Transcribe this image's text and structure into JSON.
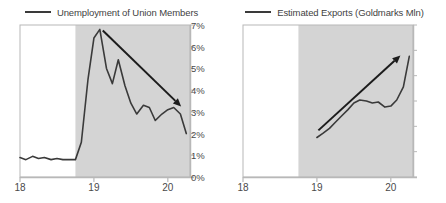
{
  "chart_data": [
    {
      "id": "unemployment",
      "type": "line",
      "title": "Unemployment of Union Members",
      "legend_label": "Unemployment of Union Members",
      "legend_position": "top-center",
      "xlabel": "",
      "ylabel": "",
      "ylim": [
        0,
        7
      ],
      "xlim": [
        18.0,
        20.3
      ],
      "y_ticks": [
        "0%",
        "1%",
        "2%",
        "3%",
        "4%",
        "5%",
        "6%",
        "7%"
      ],
      "y_tick_values": [
        0,
        1,
        2,
        3,
        4,
        5,
        6,
        7
      ],
      "x_ticks": [
        "18",
        "19",
        "20"
      ],
      "x_tick_values": [
        18,
        19,
        20
      ],
      "grid": false,
      "shaded_region": {
        "from": 18.75,
        "to": 20.3,
        "color": "#d4d4d4",
        "label": ""
      },
      "series": [
        {
          "name": "Unemployment of Union Members",
          "color": "#3a3a3a",
          "x": [
            18.0,
            18.08,
            18.17,
            18.25,
            18.33,
            18.42,
            18.5,
            18.58,
            18.67,
            18.75,
            18.83,
            18.92,
            19.0,
            19.08,
            19.17,
            19.25,
            19.33,
            19.42,
            19.5,
            19.58,
            19.67,
            19.75,
            19.83,
            19.92,
            20.0,
            20.08,
            20.17,
            20.25
          ],
          "values": [
            0.9,
            0.8,
            0.95,
            0.85,
            0.9,
            0.8,
            0.85,
            0.8,
            0.8,
            0.8,
            1.6,
            4.5,
            6.4,
            6.8,
            5.0,
            4.3,
            5.4,
            4.2,
            3.4,
            2.9,
            3.3,
            3.2,
            2.6,
            2.9,
            3.1,
            3.2,
            2.9,
            2.0
          ]
        }
      ],
      "annotations": [
        {
          "type": "trend-arrow",
          "direction": "down",
          "from": {
            "x": 19.12,
            "y": 6.75
          },
          "to": {
            "x": 20.18,
            "y": 3.25
          },
          "color": "#1c1c1c"
        }
      ]
    },
    {
      "id": "exports",
      "type": "line",
      "title": "Estimated Exports (Goldmarks Mln)",
      "legend_label": "Estimated Exports (Goldmarks Mln)",
      "legend_position": "top-center",
      "xlabel": "",
      "ylabel": "",
      "ylim": [
        0,
        300
      ],
      "xlim": [
        18.0,
        20.3
      ],
      "y_ticks": [
        "0",
        "50",
        "100",
        "150",
        "200",
        "250",
        "300"
      ],
      "y_tick_values": [
        0,
        50,
        100,
        150,
        200,
        250,
        300
      ],
      "x_ticks": [
        "18",
        "19",
        "20"
      ],
      "x_tick_values": [
        18,
        19,
        20
      ],
      "grid": false,
      "shaded_region": {
        "from": 18.75,
        "to": 20.3,
        "color": "#d4d4d4",
        "label": ""
      },
      "series": [
        {
          "name": "Estimated Exports (Goldmarks Mln)",
          "color": "#3a3a3a",
          "x": [
            19.0,
            19.08,
            19.17,
            19.25,
            19.33,
            19.42,
            19.5,
            19.58,
            19.67,
            19.75,
            19.83,
            19.92,
            20.0,
            20.08,
            20.17,
            20.25
          ],
          "values": [
            78,
            86,
            96,
            108,
            120,
            133,
            146,
            152,
            150,
            146,
            148,
            138,
            140,
            152,
            178,
            238
          ]
        }
      ],
      "annotations": [
        {
          "type": "trend-arrow",
          "direction": "up",
          "from": {
            "x": 19.02,
            "y": 92
          },
          "to": {
            "x": 20.13,
            "y": 240
          },
          "color": "#1c1c1c"
        }
      ]
    }
  ],
  "panels": {
    "left": {
      "legend": {
        "label": "Unemployment of Union Members"
      },
      "y_ticks": [
        "7%",
        "6%",
        "5%",
        "4%",
        "3%",
        "2%",
        "1%",
        "0%"
      ],
      "x_ticks": [
        "18",
        "19",
        "20"
      ]
    },
    "right": {
      "legend": {
        "label": "Estimated Exports (Goldmarks Mln)"
      },
      "y_ticks": [
        "300",
        "250",
        "200",
        "150",
        "100",
        "50",
        "0"
      ],
      "x_ticks": [
        "18",
        "19",
        "20"
      ]
    }
  },
  "colors": {
    "line": "#3a3a3a",
    "arrow": "#1c1c1c",
    "shaded": "#d4d4d4",
    "axis": "#b8b8b8",
    "text": "#4a4a4a"
  }
}
